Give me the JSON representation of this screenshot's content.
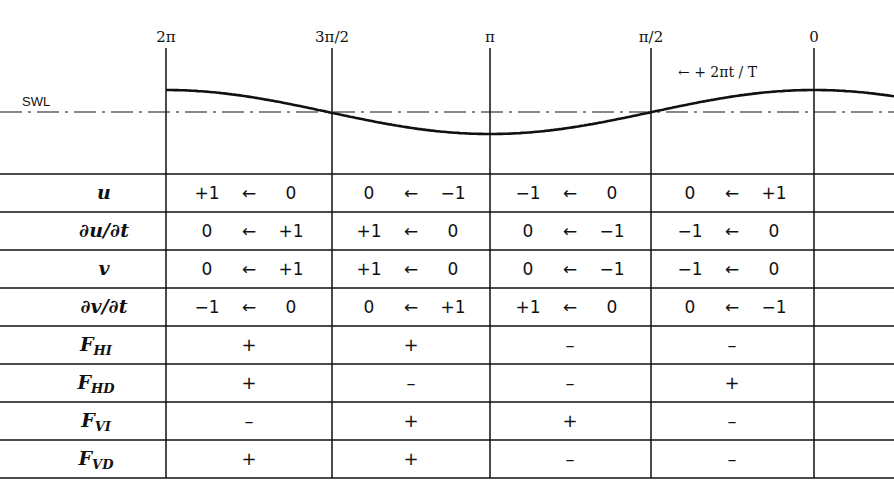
{
  "phase_labels": [
    "2π",
    "3π/2",
    "π",
    "π/2",
    "0"
  ],
  "swl_label": "SWL",
  "direction_label": "← + 2πt / T",
  "rows": [
    {
      "label": "u",
      "sub": "",
      "cells": [
        {
          "from": "+1",
          "arrow": "←",
          "to": "0"
        },
        {
          "from": "0",
          "arrow": "←",
          "to": "−1"
        },
        {
          "from": "−1",
          "arrow": "←",
          "to": "0"
        },
        {
          "from": "0",
          "arrow": "←",
          "to": "+1"
        }
      ]
    },
    {
      "label": "∂u/∂t",
      "sub": "",
      "cells": [
        {
          "from": "0",
          "arrow": "←",
          "to": "+1"
        },
        {
          "from": "+1",
          "arrow": "←",
          "to": "0"
        },
        {
          "from": "0",
          "arrow": "←",
          "to": "−1"
        },
        {
          "from": "−1",
          "arrow": "←",
          "to": "0"
        }
      ]
    },
    {
      "label": "v",
      "sub": "",
      "cells": [
        {
          "from": "0",
          "arrow": "←",
          "to": "+1"
        },
        {
          "from": "+1",
          "arrow": "←",
          "to": "0"
        },
        {
          "from": "0",
          "arrow": "←",
          "to": "−1"
        },
        {
          "from": "−1",
          "arrow": "←",
          "to": "0"
        }
      ]
    },
    {
      "label": "∂v/∂t",
      "sub": "",
      "cells": [
        {
          "from": "−1",
          "arrow": "←",
          "to": "0"
        },
        {
          "from": "0",
          "arrow": "←",
          "to": "+1"
        },
        {
          "from": "+1",
          "arrow": "←",
          "to": "0"
        },
        {
          "from": "0",
          "arrow": "←",
          "to": "−1"
        }
      ]
    },
    {
      "label": "F",
      "sub": "HI",
      "signs": [
        "+",
        "+",
        "–",
        "–"
      ]
    },
    {
      "label": "F",
      "sub": "HD",
      "signs": [
        "+",
        "–",
        "–",
        "+"
      ]
    },
    {
      "label": "F",
      "sub": "VI",
      "signs": [
        "–",
        "+",
        "+",
        "–"
      ]
    },
    {
      "label": "F",
      "sub": "VD",
      "signs": [
        "+",
        "+",
        "–",
        "–"
      ]
    }
  ]
}
